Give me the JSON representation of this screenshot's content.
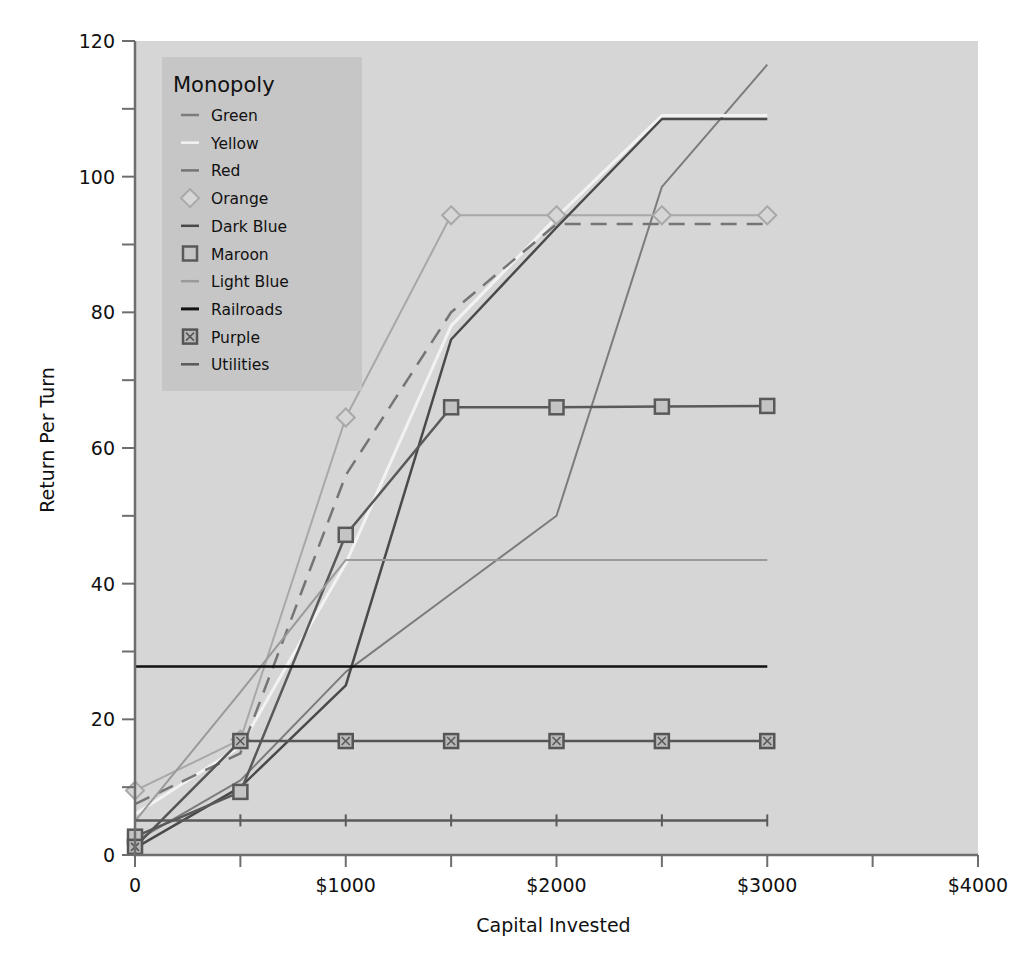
{
  "chart_data": {
    "type": "line",
    "title": "",
    "xlabel": "Capital Invested",
    "ylabel": "Return Per Turn",
    "xlim": [
      0,
      4000
    ],
    "ylim": [
      0,
      120
    ],
    "x_ticks": [
      0,
      500,
      1000,
      1500,
      2000,
      2500,
      3000,
      3500,
      4000
    ],
    "x_tick_labels": [
      {
        "value": 0,
        "label": "0"
      },
      {
        "value": 1000,
        "label": "$1000"
      },
      {
        "value": 2000,
        "label": "$2000"
      },
      {
        "value": 3000,
        "label": "$3000"
      },
      {
        "value": 4000,
        "label": "$4000"
      }
    ],
    "y_ticks": [
      0,
      10,
      20,
      30,
      40,
      50,
      60,
      70,
      80,
      90,
      100,
      110,
      120
    ],
    "y_tick_labels": [
      {
        "value": 0,
        "label": "0"
      },
      {
        "value": 20,
        "label": "20"
      },
      {
        "value": 40,
        "label": "40"
      },
      {
        "value": 60,
        "label": "60"
      },
      {
        "value": 80,
        "label": "80"
      },
      {
        "value": 100,
        "label": "100"
      },
      {
        "value": 120,
        "label": "120"
      }
    ],
    "grid": false,
    "legend": {
      "title": "Monopoly",
      "position": "upper-left"
    },
    "x": [
      0,
      500,
      1000,
      1500,
      2000,
      2500,
      3000
    ],
    "series": [
      {
        "name": "Green",
        "color": "#7c7c7c",
        "width": 2,
        "dash": "",
        "marker": "none",
        "values": [
          2,
          11,
          27,
          38.5,
          50,
          98.5,
          116.5
        ]
      },
      {
        "name": "Yellow",
        "color": "#f2f2f2",
        "width": 3,
        "dash": "",
        "marker": "none",
        "values": [
          6,
          16,
          43,
          78,
          94,
          109,
          109
        ]
      },
      {
        "name": "Red",
        "color": "#757575",
        "width": 2.5,
        "dash": "16,10",
        "marker": "none",
        "values": [
          7.5,
          15,
          56,
          80,
          93,
          93,
          93
        ]
      },
      {
        "name": "Orange",
        "color": "#a8a8a8",
        "width": 2,
        "dash": "",
        "marker": "diamond",
        "values": [
          9.5,
          17,
          64.5,
          94.3,
          94.3,
          94.3,
          94.3
        ]
      },
      {
        "name": "Dark Blue",
        "color": "#4a4a4a",
        "width": 2.5,
        "dash": "",
        "marker": "none",
        "values": [
          1,
          10,
          25,
          76,
          92.5,
          108.5,
          108.5
        ]
      },
      {
        "name": "Maroon",
        "color": "#595959",
        "width": 2.5,
        "dash": "",
        "marker": "square",
        "values": [
          2.7,
          9.3,
          47.2,
          66,
          66,
          66.1,
          66.2
        ]
      },
      {
        "name": "Light Blue",
        "color": "#9a9a9a",
        "width": 2,
        "dash": "",
        "marker": "none",
        "values": [
          5,
          24,
          43.5,
          43.5,
          43.5,
          43.5,
          43.5
        ]
      },
      {
        "name": "Railroads",
        "color": "#111111",
        "width": 2.5,
        "dash": "",
        "marker": "none",
        "values": [
          27.8,
          27.8,
          27.8,
          27.8,
          27.8,
          27.8,
          27.8
        ]
      },
      {
        "name": "Purple",
        "color": "#555555",
        "width": 2.5,
        "dash": "",
        "marker": "crossed-square",
        "values": [
          1.2,
          16.8,
          16.8,
          16.8,
          16.8,
          16.8,
          16.8
        ]
      },
      {
        "name": "Utilities",
        "color": "#5a5a5a",
        "width": 2.5,
        "dash": "",
        "marker": "vtick",
        "values": [
          5.1,
          5.1,
          5.1,
          5.1,
          5.1,
          5.1,
          5.1
        ]
      }
    ]
  },
  "colors": {
    "plot_background": "#d6d6d6",
    "legend_background": "#c6c6c6",
    "axis": "#6e6e6e"
  }
}
